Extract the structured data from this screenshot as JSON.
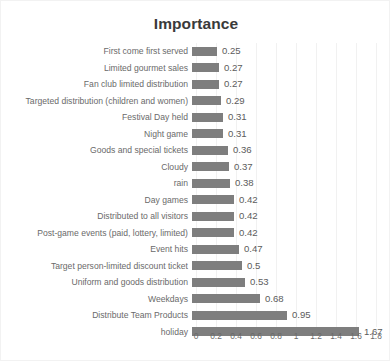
{
  "chart_data": {
    "type": "bar",
    "title": "Importance",
    "orientation": "horizontal",
    "xlabel": "",
    "ylabel": "",
    "xlim": [
      0,
      1.8
    ],
    "grid": true,
    "legend": "none",
    "bar_color": "#7e7e7e",
    "xticks": [
      "0",
      "0.2",
      "0.4",
      "0.6",
      "0.8",
      "1",
      "1.2",
      "1.4",
      "1.6",
      "1.8"
    ],
    "xtick_values": [
      0,
      0.2,
      0.4,
      0.6,
      0.8,
      1,
      1.2,
      1.4,
      1.6,
      1.8
    ],
    "categories": [
      "First come first served",
      "Limited gourmet sales",
      "Fan club limited distribution",
      "Targeted distribution (children and women)",
      "Festival Day held",
      "Night game",
      "Goods and special tickets",
      "Cloudy",
      "rain",
      "Day games",
      "Distributed to all visitors",
      "Post-game events (paid, lottery, limited)",
      "Event hits",
      "Target person-limited discount ticket",
      "Uniform and goods distribution",
      "Weekdays",
      "Distribute Team Products",
      "holiday"
    ],
    "values": [
      0.25,
      0.27,
      0.27,
      0.29,
      0.31,
      0.31,
      0.36,
      0.37,
      0.38,
      0.42,
      0.42,
      0.42,
      0.47,
      0.5,
      0.53,
      0.68,
      0.95,
      1.67
    ],
    "value_labels": [
      "0.25",
      "0.27",
      "0.27",
      "0.29",
      "0.31",
      "0.31",
      "0.36",
      "0.37",
      "0.38",
      "0.42",
      "0.42",
      "0.42",
      "0.47",
      "0.5",
      "0.53",
      "0.68",
      "0.95",
      "1.67"
    ]
  }
}
